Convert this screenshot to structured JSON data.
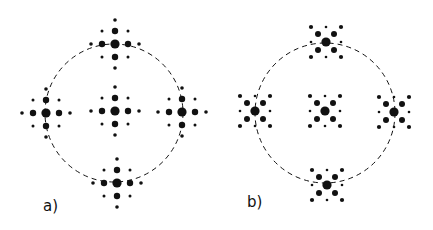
{
  "figure": {
    "background": "#ffffff",
    "ink": "#111111",
    "panels": [
      {
        "id": "a",
        "label": "a)",
        "label_pos": [
          43,
          212
        ],
        "pattern": "cross",
        "circle": {
          "cx": 114,
          "cy": 113,
          "r": 69
        },
        "clusters": [
          {
            "name": "center",
            "x": 115,
            "y": 111
          },
          {
            "name": "top",
            "x": 115,
            "y": 44
          },
          {
            "name": "bottom",
            "x": 117,
            "y": 183
          },
          {
            "name": "left",
            "x": 46,
            "y": 113
          },
          {
            "name": "right",
            "x": 182,
            "y": 112
          }
        ]
      },
      {
        "id": "b",
        "label": "b)",
        "label_pos": [
          247,
          208
        ],
        "pattern": "x",
        "circle": {
          "cx": 325,
          "cy": 113,
          "r": 70
        },
        "clusters": [
          {
            "name": "center",
            "x": 325,
            "y": 111
          },
          {
            "name": "top",
            "x": 326,
            "y": 42
          },
          {
            "name": "bottom",
            "x": 327,
            "y": 185
          },
          {
            "name": "left",
            "x": 255,
            "y": 111
          },
          {
            "name": "right",
            "x": 394,
            "y": 112
          }
        ]
      }
    ],
    "patterns": {
      "cross": [
        [
          0,
          0,
          4.6
        ],
        [
          13,
          0,
          3.2
        ],
        [
          -13,
          0,
          3.2
        ],
        [
          0,
          13,
          3.2
        ],
        [
          0,
          -13,
          3.2
        ],
        [
          24,
          0,
          1.8
        ],
        [
          -24,
          0,
          1.8
        ],
        [
          0,
          24,
          1.8
        ],
        [
          0,
          -24,
          1.8
        ],
        [
          13,
          13,
          1.5
        ],
        [
          -13,
          13,
          1.5
        ],
        [
          13,
          -13,
          1.5
        ],
        [
          -13,
          -13,
          1.5
        ]
      ],
      "x": [
        [
          0,
          0,
          4.6
        ],
        [
          8,
          8,
          3.0
        ],
        [
          -8,
          8,
          3.0
        ],
        [
          8,
          -8,
          3.0
        ],
        [
          -8,
          -8,
          3.0
        ],
        [
          15,
          15,
          2.1
        ],
        [
          -15,
          15,
          2.1
        ],
        [
          15,
          -15,
          2.1
        ],
        [
          -15,
          -15,
          2.1
        ],
        [
          15,
          0,
          1.3
        ],
        [
          -15,
          0,
          1.3
        ],
        [
          0,
          15,
          1.3
        ],
        [
          0,
          -15,
          1.3
        ]
      ]
    }
  }
}
